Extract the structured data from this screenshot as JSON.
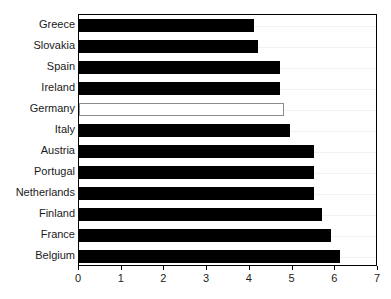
{
  "chart_data": {
    "type": "bar",
    "orientation": "horizontal",
    "title": "",
    "subtitle": "",
    "xlabel": "",
    "ylabel": "",
    "xlim": [
      0,
      7
    ],
    "ylim": null,
    "grid": true,
    "legend": null,
    "xticks": [
      "0",
      "1",
      "2",
      "3",
      "4",
      "5",
      "6",
      "7"
    ],
    "categories": [
      "Greece",
      "Slovakia",
      "Spain",
      "Ireland",
      "Germany",
      "Italy",
      "Austria",
      "Portugal",
      "Netherlands",
      "Finland",
      "France",
      "Belgium"
    ],
    "values": [
      4.1,
      4.2,
      4.7,
      4.7,
      4.8,
      4.95,
      5.5,
      5.5,
      5.5,
      5.7,
      5.9,
      6.1
    ],
    "highlighted": [
      "Germany"
    ],
    "colors": {
      "bar_fill": "#000000",
      "highlight_fill": "#ffffff",
      "highlight_outline": "#8c8c8c",
      "axis": "#000000",
      "grid": "#f2f2f2",
      "text": "#1a1a1a",
      "background": "#ffffff"
    }
  }
}
